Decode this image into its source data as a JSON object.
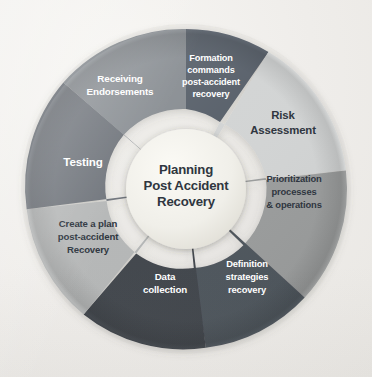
{
  "diagram": {
    "background_color": "#efedea",
    "hub": {
      "name": "hub",
      "fill": "#f0efe9",
      "text_color": "#2f3640",
      "lines": [
        "Planning",
        "Post Accident",
        "Recovery"
      ]
    },
    "segments": [
      {
        "id": "formation-commands",
        "lines": [
          "Formation",
          "commands",
          "post-accident",
          "recovery"
        ],
        "fill": "#58606b",
        "text_color": "#ffffff",
        "text_tone": "light",
        "font_size": 9.2
      },
      {
        "id": "risk-assessment",
        "lines": [
          "Risk",
          "Assessment"
        ],
        "fill": "#d2d4d4",
        "text_color": "#2f3640",
        "text_tone": "dark",
        "font_size": 11.4
      },
      {
        "id": "prioritization-processes",
        "lines": [
          "Prioritization",
          "processes",
          "& operations"
        ],
        "fill": "#9a9c9c",
        "text_color": "#2f3640",
        "text_tone": "dark",
        "font_size": 9.4
      },
      {
        "id": "definition-strategies",
        "lines": [
          "Definition",
          "strategies",
          "recovery"
        ],
        "fill": "#4e545c",
        "text_color": "#ffffff",
        "text_tone": "light",
        "font_size": 9.4
      },
      {
        "id": "data-collection",
        "lines": [
          "Data",
          "collection"
        ],
        "fill": "#3f444b",
        "text_color": "#ffffff",
        "text_tone": "light",
        "font_size": 9.8
      },
      {
        "id": "create-a-plan",
        "lines": [
          "Create a plan",
          "post-accident",
          "Recovery"
        ],
        "fill": "#b4b6b6",
        "text_color": "#2f3640",
        "text_tone": "dark",
        "font_size": 9.6
      },
      {
        "id": "testing",
        "lines": [
          "Testing"
        ],
        "fill": "#6c7178",
        "text_color": "#ffffff",
        "text_tone": "light",
        "font_size": 11.6
      },
      {
        "id": "receiving-endorsements",
        "lines": [
          "Receiving",
          "Endorsements"
        ],
        "fill": "#878c91",
        "text_color": "#ffffff",
        "text_tone": "light",
        "font_size": 9.9
      }
    ]
  }
}
